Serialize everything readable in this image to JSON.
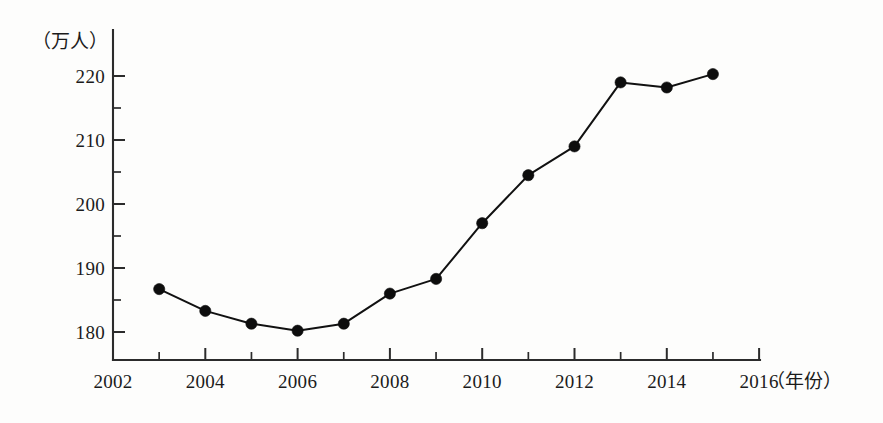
{
  "chart_data": {
    "type": "line",
    "title": "",
    "xlabel": "(年份)",
    "ylabel": "(万人)",
    "x": [
      2003,
      2004,
      2005,
      2006,
      2007,
      2008,
      2009,
      2010,
      2011,
      2012,
      2013,
      2014,
      2015
    ],
    "values": [
      186.7,
      183.3,
      181.3,
      180.2,
      181.3,
      186.0,
      188.3,
      197.0,
      204.5,
      209.0,
      219.0,
      218.2,
      220.3
    ],
    "series": [
      {
        "name": "人口",
        "values": [
          186.7,
          183.3,
          181.3,
          180.2,
          181.3,
          186.0,
          188.3,
          197.0,
          204.5,
          209.0,
          219.0,
          218.2,
          220.3
        ]
      }
    ],
    "xlim": [
      2002,
      2016
    ],
    "ylim": [
      176,
      223
    ],
    "grid": false,
    "legend": false,
    "legend_position": "none",
    "marker": "filled-circle",
    "line_color": "#111111",
    "marker_color": "#0d0d0d",
    "axis_color": "#2b2b2b",
    "background_color": "#fdfdfc",
    "x_tick_labels": [
      "2002",
      "2004",
      "2006",
      "2008",
      "2010",
      "2012",
      "2014",
      "2016"
    ],
    "x_tick_values": [
      2002,
      2004,
      2006,
      2008,
      2010,
      2012,
      2014,
      2016
    ],
    "x_minor_tick_values": [
      2003,
      2005,
      2007,
      2009,
      2011,
      2013,
      2015
    ],
    "y_tick_labels": [
      "180",
      "190",
      "200",
      "210",
      "220"
    ],
    "y_tick_values": [
      180,
      190,
      200,
      210,
      220
    ],
    "y_minor_tick_values": [
      185,
      195,
      205,
      215
    ],
    "annotations": []
  },
  "axis": {
    "y_unit_label": "（万人）",
    "x_unit_label": "（年份）"
  },
  "ticks": {
    "y_labels": [
      "220",
      "210",
      "200",
      "190",
      "180"
    ],
    "x_labels": [
      "2002",
      "2004",
      "2006",
      "2008",
      "2010",
      "2012",
      "2014",
      "2016"
    ]
  }
}
